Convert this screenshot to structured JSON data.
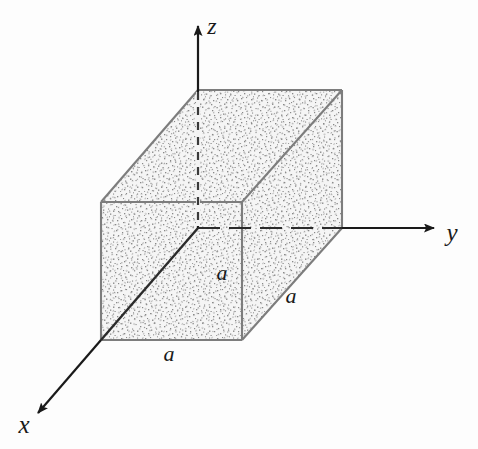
{
  "figure": {
    "kind": "3d-axonometric-diagram",
    "background_color": "#fdfdfd",
    "canvas": {
      "width": 478,
      "height": 449
    }
  },
  "colors": {
    "ink": "#1a1a1a",
    "edge_line": "#7d7d7d",
    "edge_line_dark": "#6b6b6b",
    "stipple_dot": "#8a8a8a",
    "stipple_base": "#f4f4f4",
    "axis_line": "#1a1a1a"
  },
  "axes": [
    {
      "id": "z",
      "label": "z",
      "label_x": 212,
      "label_y": 34,
      "direction": "up",
      "arrow": true,
      "solid_from": {
        "x": 198,
        "y": 22
      },
      "solid_to": {
        "x": 198,
        "y": 90
      },
      "hidden_from": {
        "x": 198,
        "y": 90
      },
      "hidden_to": {
        "x": 198,
        "y": 228
      },
      "hidden_style": "dashed"
    },
    {
      "id": "y",
      "label": "y",
      "label_x": 452,
      "label_y": 240,
      "direction": "right",
      "arrow": true,
      "solid_from": {
        "x": 342,
        "y": 228
      },
      "solid_to": {
        "x": 438,
        "y": 228
      },
      "hidden_from": {
        "x": 198,
        "y": 228
      },
      "hidden_to": {
        "x": 342,
        "y": 228
      },
      "hidden_style": "dashed"
    },
    {
      "id": "x",
      "label": "x",
      "label_x": 24,
      "label_y": 432,
      "direction": "down-left",
      "arrow": true,
      "solid_from": {
        "x": 102,
        "y": 340
      },
      "solid_to": {
        "x": 34,
        "y": 410
      },
      "hidden_from": {
        "x": 198,
        "y": 228
      },
      "hidden_to": {
        "x": 102,
        "y": 340
      },
      "hidden_style": "solid-diagonal"
    }
  ],
  "origin": {
    "x": 198,
    "y": 228
  },
  "box": {
    "edge_length_label": "a",
    "front_face": {
      "top_left": {
        "x": 101,
        "y": 202
      },
      "top_right": {
        "x": 242,
        "y": 202
      },
      "bottom_right": {
        "x": 242,
        "y": 340
      },
      "bottom_left": {
        "x": 101,
        "y": 340
      }
    },
    "depth_offset": {
      "dx": 141,
      "dy": -112
    },
    "back_face": {
      "top_left": {
        "x": 242,
        "y": 90
      },
      "top_right": {
        "x": 342,
        "y": 90
      },
      "bottom_right": {
        "x": 342,
        "y": 228
      },
      "bottom_left": {
        "x": 242,
        "y": 228
      }
    }
  },
  "dimension_labels": [
    {
      "id": "a-vertical-front",
      "text": "a",
      "x": 222,
      "y": 280
    },
    {
      "id": "a-depth-right",
      "text": "a",
      "x": 291,
      "y": 302
    },
    {
      "id": "a-horizontal-bottom",
      "text": "a",
      "x": 168,
      "y": 360
    }
  ]
}
